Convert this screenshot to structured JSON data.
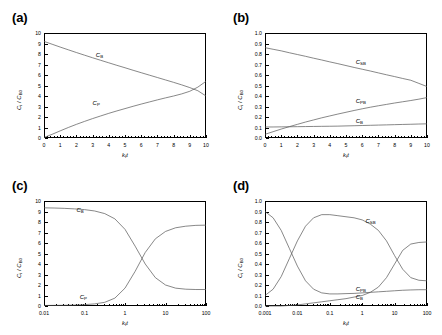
{
  "figure": {
    "panels": [
      {
        "tag": "(a)",
        "xlabel": "k f t",
        "ylabel": "C i / C B0",
        "xscale": "linear",
        "yscale": "linear",
        "xticks": [
          "0",
          "1",
          "2",
          "3",
          "4",
          "5",
          "6",
          "7",
          "8",
          "9",
          "10"
        ],
        "yticks": [
          "0",
          "1",
          "2",
          "3",
          "4",
          "5",
          "6",
          "7",
          "8",
          "9",
          "10"
        ],
        "curve_labels": [
          "C B",
          "C P"
        ]
      },
      {
        "tag": "(b)",
        "xlabel": "k f t",
        "ylabel": "C i / C B0",
        "xscale": "linear",
        "yscale": "linear",
        "xticks": [
          "0",
          "1",
          "2",
          "3",
          "4",
          "5",
          "6",
          "7",
          "8",
          "9",
          "10"
        ],
        "yticks": [
          "0.0",
          "0.1",
          "0.2",
          "0.3",
          "0.4",
          "0.5",
          "0.6",
          "0.7",
          "0.8",
          "0.9",
          "1.0"
        ],
        "curve_labels": [
          "C SB",
          "C PB",
          "C B"
        ]
      },
      {
        "tag": "(c)",
        "xlabel": "k f t",
        "ylabel": "C i / C B0",
        "xscale": "log",
        "yscale": "linear",
        "xticks": [
          "0.01",
          "0.1",
          "1",
          "10",
          "100"
        ],
        "yticks": [
          "0",
          "1",
          "2",
          "3",
          "4",
          "5",
          "6",
          "7",
          "8",
          "9",
          "10"
        ],
        "curve_labels": [
          "C B",
          "C P"
        ]
      },
      {
        "tag": "(d)",
        "xlabel": "k f t",
        "ylabel": "C i / C B0",
        "xscale": "log",
        "yscale": "linear",
        "xticks": [
          "0.001",
          "0.01",
          "0.1",
          "1",
          "10",
          "100"
        ],
        "yticks": [
          "0.0",
          "0.1",
          "0.2",
          "0.3",
          "0.4",
          "0.5",
          "0.6",
          "0.7",
          "0.8",
          "0.9",
          "1.0"
        ],
        "curve_labels": [
          "C SB",
          "C PB",
          "C B"
        ]
      }
    ]
  },
  "chart_data": [
    {
      "type": "line",
      "panel": "(a)",
      "title": "",
      "xlabel": "k_f t",
      "ylabel": "C_i / C_B0",
      "xscale": "linear",
      "yscale": "linear",
      "xlim": [
        0,
        10
      ],
      "ylim": [
        0,
        10
      ],
      "grid": false,
      "legend": "inline-annotations",
      "x": [
        0,
        0.5,
        1,
        1.5,
        2,
        2.5,
        3,
        3.5,
        4,
        4.5,
        5,
        5.5,
        6,
        6.5,
        7,
        7.5,
        8,
        8.5,
        9,
        9.5,
        10
      ],
      "series": [
        {
          "name": "C_B",
          "label": "C B",
          "values": [
            9.2,
            8.93,
            8.66,
            8.4,
            8.14,
            7.89,
            7.64,
            7.4,
            7.16,
            6.92,
            6.69,
            6.45,
            6.22,
            5.99,
            5.76,
            5.53,
            5.3,
            5.06,
            4.8,
            4.5,
            4.0
          ]
        },
        {
          "name": "C_P",
          "label": "C P",
          "values": [
            0.05,
            0.35,
            0.68,
            1.0,
            1.3,
            1.58,
            1.85,
            2.1,
            2.35,
            2.58,
            2.8,
            3.02,
            3.23,
            3.43,
            3.63,
            3.82,
            4.0,
            4.2,
            4.45,
            4.85,
            5.4
          ]
        }
      ]
    },
    {
      "type": "line",
      "panel": "(b)",
      "title": "",
      "xlabel": "k_f t",
      "ylabel": "C_i / C_B0",
      "xscale": "linear",
      "yscale": "linear",
      "xlim": [
        0,
        10
      ],
      "ylim": [
        0.0,
        1.0
      ],
      "grid": false,
      "legend": "inline-annotations",
      "x": [
        0,
        0.5,
        1,
        1.5,
        2,
        2.5,
        3,
        3.5,
        4,
        4.5,
        5,
        5.5,
        6,
        6.5,
        7,
        7.5,
        8,
        8.5,
        9,
        9.5,
        10
      ],
      "series": [
        {
          "name": "C_SB",
          "label": "C SB",
          "values": [
            0.86,
            0.845,
            0.83,
            0.812,
            0.795,
            0.778,
            0.76,
            0.743,
            0.725,
            0.708,
            0.69,
            0.672,
            0.655,
            0.638,
            0.62,
            0.602,
            0.585,
            0.567,
            0.55,
            0.52,
            0.49
          ]
        },
        {
          "name": "C_PB",
          "label": "C PB",
          "values": [
            0.035,
            0.06,
            0.085,
            0.108,
            0.13,
            0.152,
            0.172,
            0.192,
            0.21,
            0.228,
            0.245,
            0.262,
            0.278,
            0.293,
            0.307,
            0.32,
            0.333,
            0.345,
            0.357,
            0.37,
            0.385
          ]
        },
        {
          "name": "C_B",
          "label": "C B",
          "values": [
            0.105,
            0.105,
            0.106,
            0.107,
            0.108,
            0.109,
            0.11,
            0.111,
            0.112,
            0.113,
            0.115,
            0.117,
            0.119,
            0.121,
            0.123,
            0.125,
            0.127,
            0.129,
            0.131,
            0.133,
            0.135
          ]
        }
      ]
    },
    {
      "type": "line",
      "panel": "(c)",
      "title": "",
      "xlabel": "k_f t",
      "ylabel": "C_i / C_B0",
      "xscale": "log",
      "yscale": "linear",
      "xlim": [
        0.01,
        100
      ],
      "ylim": [
        0,
        10
      ],
      "grid": false,
      "legend": "inline-annotations",
      "x": [
        0.01,
        0.0178,
        0.0316,
        0.0562,
        0.1,
        0.178,
        0.316,
        0.562,
        1,
        1.78,
        3.16,
        5.62,
        10,
        17.8,
        31.6,
        56.2,
        100
      ],
      "series": [
        {
          "name": "C_B",
          "label": "C B",
          "values": [
            9.35,
            9.33,
            9.3,
            9.25,
            9.18,
            9.05,
            8.8,
            8.3,
            7.3,
            5.7,
            4.0,
            2.7,
            2.0,
            1.7,
            1.6,
            1.57,
            1.57
          ]
        },
        {
          "name": "C_P",
          "label": "C P",
          "values": [
            0.05,
            0.06,
            0.07,
            0.09,
            0.13,
            0.2,
            0.35,
            0.75,
            1.7,
            3.3,
            5.1,
            6.4,
            7.1,
            7.45,
            7.6,
            7.68,
            7.7
          ]
        }
      ]
    },
    {
      "type": "line",
      "panel": "(d)",
      "title": "",
      "xlabel": "k_f t",
      "ylabel": "C_i / C_B0",
      "xscale": "log",
      "yscale": "linear",
      "xlim": [
        0.001,
        100
      ],
      "ylim": [
        0.0,
        1.0
      ],
      "grid": false,
      "legend": "inline-annotations",
      "x": [
        0.001,
        0.00178,
        0.00316,
        0.00562,
        0.01,
        0.0178,
        0.0316,
        0.0562,
        0.1,
        0.178,
        0.316,
        0.562,
        1,
        1.78,
        3.16,
        5.62,
        10,
        17.8,
        31.6,
        56.2,
        100
      ],
      "series": [
        {
          "name": "C_SB",
          "label": "C SB",
          "values": [
            0.1,
            0.16,
            0.28,
            0.45,
            0.62,
            0.76,
            0.84,
            0.87,
            0.87,
            0.86,
            0.85,
            0.84,
            0.82,
            0.78,
            0.72,
            0.62,
            0.48,
            0.35,
            0.27,
            0.245,
            0.24
          ]
        },
        {
          "name": "C_PB",
          "label": "C PB",
          "values": [
            0.0,
            0.0,
            0.0,
            0.005,
            0.01,
            0.02,
            0.03,
            0.04,
            0.05,
            0.06,
            0.07,
            0.085,
            0.1,
            0.13,
            0.18,
            0.27,
            0.4,
            0.53,
            0.59,
            0.605,
            0.61
          ]
        },
        {
          "name": "C_B",
          "label": "C B",
          "values": [
            0.9,
            0.84,
            0.72,
            0.55,
            0.38,
            0.24,
            0.16,
            0.125,
            0.115,
            0.115,
            0.118,
            0.12,
            0.125,
            0.13,
            0.135,
            0.14,
            0.145,
            0.15,
            0.153,
            0.155,
            0.155
          ]
        }
      ]
    }
  ]
}
